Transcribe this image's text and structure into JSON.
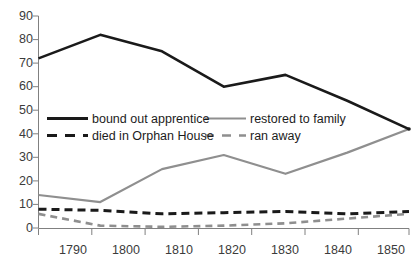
{
  "chart_data": {
    "type": "line",
    "title": "",
    "subtitle": "",
    "xlabel": "",
    "ylabel": "",
    "categories": [
      1790,
      1800,
      1810,
      1820,
      1830,
      1840,
      1850
    ],
    "x_tick_labels": [
      "1790",
      "1800",
      "1810",
      "1820",
      "1830",
      "1840",
      "1850"
    ],
    "y_tick_labels": [
      "0",
      "10",
      "20",
      "30",
      "40",
      "50",
      "60",
      "70",
      "80",
      "90"
    ],
    "y_ticks": [
      0,
      10,
      20,
      30,
      40,
      50,
      60,
      70,
      80,
      90
    ],
    "xlim": [
      1790,
      1850
    ],
    "ylim": [
      0,
      90
    ],
    "grid": false,
    "legend_position": "inside-upper-left",
    "series": [
      {
        "name": "bound out apprentice",
        "style": "solid",
        "color": "#1a1a1a",
        "values": [
          72,
          82,
          75,
          60,
          65,
          54,
          42
        ]
      },
      {
        "name": "restored to family",
        "style": "solid",
        "color": "#8f8f8f",
        "values": [
          14,
          11,
          25,
          31,
          23,
          32,
          42
        ]
      },
      {
        "name": "died in Orphan House",
        "style": "dashed",
        "color": "#1a1a1a",
        "values": [
          8,
          7.5,
          6,
          6.5,
          7,
          6,
          7
        ]
      },
      {
        "name": "ran away",
        "style": "dashed",
        "color": "#8f8f8f",
        "values": [
          6,
          1,
          0.5,
          1,
          2,
          4,
          6
        ]
      }
    ]
  },
  "axes": {
    "y_labels": [
      "90",
      "80",
      "70",
      "60",
      "50",
      "40",
      "30",
      "20",
      "10",
      "0"
    ],
    "x_labels": [
      "1790",
      "1800",
      "1810",
      "1820",
      "1830",
      "1840",
      "1850"
    ]
  },
  "legend": {
    "entries": [
      {
        "label": "bound out apprentice"
      },
      {
        "label": "restored to family"
      },
      {
        "label": "died in Orphan House"
      },
      {
        "label": "ran away"
      }
    ]
  },
  "colors": {
    "series_dark": "#1a1a1a",
    "series_light": "#8f8f8f",
    "axis": "#808080",
    "text": "#3b3b3b"
  }
}
